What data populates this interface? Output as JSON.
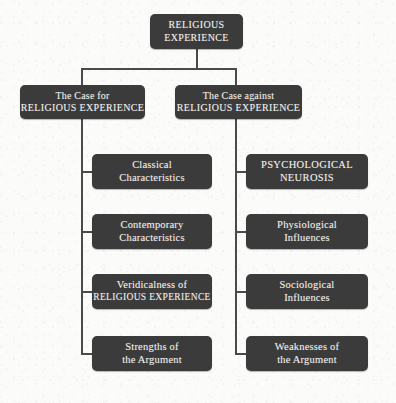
{
  "diagram": {
    "background_color": "#fbfbfa",
    "node_color": "#3b3b3b",
    "text_color": "#f2f1ee",
    "connector_color": "#4a4a4a",
    "root": {
      "line1": "RELIGIOUS",
      "line2": "EXPERIENCE"
    },
    "branches": [
      {
        "side": "left",
        "header": {
          "line1": "The Case for",
          "line2": "RELIGIOUS EXPERIENCE"
        },
        "children": [
          {
            "line1": "Classical",
            "line2": "Characteristics"
          },
          {
            "line1": "Contemporary",
            "line2": "Characteristics"
          },
          {
            "line1": "Veridicalness of",
            "line2": "RELIGIOUS EXPERIENCE"
          },
          {
            "line1": "Strengths of",
            "line2": "the Argument"
          }
        ]
      },
      {
        "side": "right",
        "header": {
          "line1": "The Case against",
          "line2": "RELIGIOUS EXPERIENCE"
        },
        "children": [
          {
            "line1": "PSYCHOLOGICAL",
            "line2": "NEUROSIS"
          },
          {
            "line1": "Physiological",
            "line2": "Influences"
          },
          {
            "line1": "Sociological",
            "line2": "Influences"
          },
          {
            "line1": "Weaknesses of",
            "line2": "the Argument"
          }
        ]
      }
    ]
  }
}
